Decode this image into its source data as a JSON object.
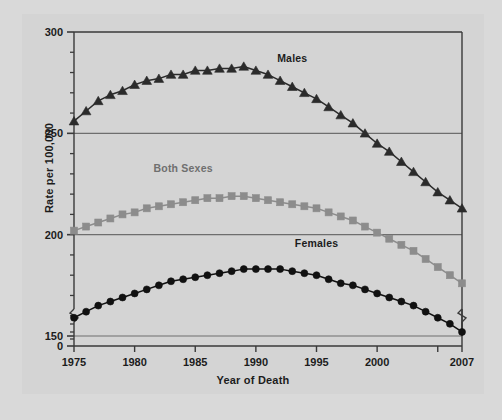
{
  "chart_data": {
    "type": "line",
    "title": "",
    "xlabel": "Year of Death",
    "ylabel": "Rate per 100,000",
    "x": [
      1975,
      1976,
      1977,
      1978,
      1979,
      1980,
      1981,
      1982,
      1983,
      1984,
      1985,
      1986,
      1987,
      1988,
      1989,
      1990,
      1991,
      1992,
      1993,
      1994,
      1995,
      1996,
      1997,
      1998,
      1999,
      2000,
      2001,
      2002,
      2003,
      2004,
      2005,
      2006,
      2007
    ],
    "xlim": [
      1975,
      2007
    ],
    "ylim": [
      150,
      300
    ],
    "y_axis_break": true,
    "y_axis_break_below": 150,
    "y_zero_shown": true,
    "xticks": [
      1975,
      1980,
      1985,
      1990,
      1995,
      2000,
      2005,
      2007
    ],
    "xtick_labels": [
      "1975",
      "1980",
      "1985",
      "1990",
      "1995",
      "2000",
      "",
      "2007"
    ],
    "yticks_major": [
      0,
      150,
      200,
      250,
      300
    ],
    "ytick_labels": [
      "0",
      "150",
      "200",
      "250",
      "300"
    ],
    "yticks_minor_step": 10,
    "grid": "horizontal-major-only",
    "legend_position": "inline-annotations",
    "series": [
      {
        "name": "Males",
        "marker": "triangle",
        "color": "#2b2b2b",
        "label_x": 1993,
        "label_y": 285,
        "values": [
          256,
          261,
          266,
          269,
          271,
          274,
          276,
          277,
          279,
          279,
          281,
          281,
          282,
          282,
          283,
          281,
          279,
          276,
          273,
          270,
          267,
          263,
          259,
          255,
          250,
          245,
          241,
          236,
          231,
          226,
          221,
          217,
          213
        ]
      },
      {
        "name": "Both Sexes",
        "marker": "square",
        "color": "#8c8c8c",
        "label_x": 1984,
        "label_y": 231,
        "values": [
          202,
          204,
          206,
          208,
          210,
          211,
          213,
          214,
          215,
          216,
          217,
          218,
          218,
          219,
          219,
          218,
          217,
          216,
          215,
          214,
          213,
          211,
          209,
          207,
          204,
          201,
          198,
          195,
          192,
          188,
          184,
          180,
          176
        ]
      },
      {
        "name": "Females",
        "marker": "circle",
        "color": "#111111",
        "label_x": 1995,
        "label_y": 194,
        "values": [
          159,
          162,
          165,
          167,
          169,
          171,
          173,
          175,
          177,
          178,
          179,
          180,
          181,
          182,
          183,
          183,
          183,
          183,
          182,
          181,
          180,
          178,
          176,
          175,
          173,
          171,
          169,
          167,
          165,
          162,
          159,
          156,
          152
        ]
      }
    ]
  },
  "axis": {
    "ytick_0": "0",
    "ytick_150": "150",
    "ytick_200": "200",
    "ytick_250": "250",
    "ytick_300": "300",
    "xtick_1975": "1975",
    "xtick_1980": "1980",
    "xtick_1985": "1985",
    "xtick_1990": "1990",
    "xtick_1995": "1995",
    "xtick_2000": "2000",
    "xtick_2007": "2007"
  },
  "labels": {
    "males": "Males",
    "both_sexes": "Both Sexes",
    "females": "Females",
    "xaxis_title": "Year of Death",
    "yaxis_title": "Rate per 100,000"
  }
}
